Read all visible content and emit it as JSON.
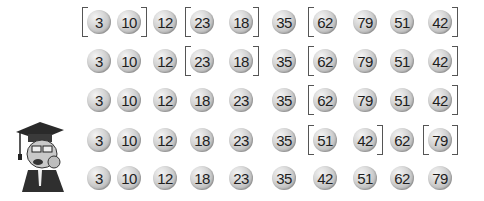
{
  "rows": [
    {
      "values": [
        3,
        10,
        12,
        23,
        18,
        35,
        62,
        79,
        51,
        42
      ],
      "brackets": [
        [
          0,
          1
        ],
        [
          3,
          4
        ],
        [
          6,
          9
        ]
      ]
    },
    {
      "values": [
        3,
        10,
        12,
        23,
        18,
        35,
        62,
        79,
        51,
        42
      ],
      "brackets": [
        [
          3,
          4
        ],
        [
          6,
          9
        ]
      ]
    },
    {
      "values": [
        3,
        10,
        12,
        18,
        23,
        35,
        62,
        79,
        51,
        42
      ],
      "brackets": [
        [
          6,
          9
        ]
      ]
    },
    {
      "values": [
        3,
        10,
        12,
        18,
        23,
        35,
        51,
        42,
        62,
        79
      ],
      "brackets": [
        [
          6,
          7
        ],
        [
          9,
          9
        ]
      ]
    },
    {
      "values": [
        3,
        10,
        12,
        18,
        23,
        35,
        42,
        51,
        62,
        79
      ],
      "brackets": []
    }
  ],
  "layout": {
    "column_x": [
      99,
      129,
      165,
      202,
      241,
      284,
      325,
      365,
      402,
      440
    ],
    "row_y": [
      22,
      61,
      100,
      140,
      178
    ]
  },
  "colors": {
    "ball_text": "#1e1e1e",
    "bracket": "#555555"
  },
  "icons": {
    "character": "professor-graduation-cap-icon"
  }
}
